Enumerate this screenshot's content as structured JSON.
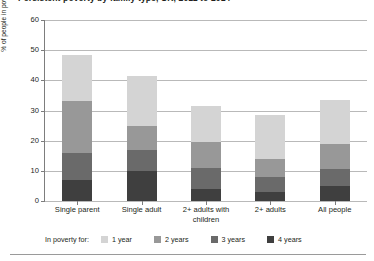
{
  "chart_data": {
    "type": "bar",
    "stacked": true,
    "title": "Persistent poverty by family type, UK, 2011 to 2014",
    "xlabel": "",
    "ylabel": "% of people in poverty at some point between 2011 and 2014",
    "ylim": [
      0,
      60
    ],
    "yticks": [
      0,
      10,
      20,
      30,
      40,
      50,
      60
    ],
    "grid": true,
    "legend_position": "bottom",
    "legend_title": "In poverty for:",
    "categories": [
      "Single parent",
      "Single adult",
      "2+ adults with children",
      "2+ adults",
      "All people"
    ],
    "series": [
      {
        "name": "1 year",
        "color": "#d4d4d4",
        "values": [
          15.5,
          16.5,
          12.0,
          14.5,
          14.5
        ]
      },
      {
        "name": "2 years",
        "color": "#989898",
        "values": [
          17.0,
          8.0,
          8.5,
          6.0,
          8.5
        ]
      },
      {
        "name": "3 years",
        "color": "#6a6a6a",
        "values": [
          9.0,
          7.0,
          7.0,
          5.0,
          5.5
        ]
      },
      {
        "name": "4 years",
        "color": "#3f3f3f",
        "values": [
          7.0,
          10.0,
          4.0,
          3.0,
          5.0
        ]
      }
    ],
    "totals": [
      48.5,
      41.5,
      31.5,
      28.5,
      33.5
    ]
  },
  "legend": {
    "title": "In poverty for:",
    "items": [
      {
        "label": "1 year"
      },
      {
        "label": "2 years"
      },
      {
        "label": "3 years"
      },
      {
        "label": "4 years"
      }
    ]
  }
}
